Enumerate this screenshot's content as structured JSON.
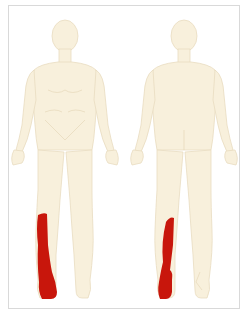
{
  "diagram": {
    "type": "body-pain-map",
    "views": [
      {
        "name": "front",
        "highlighted_regions": [
          "right-lower-leg-lateral",
          "right-foot"
        ]
      },
      {
        "name": "back",
        "highlighted_regions": [
          "left-lower-leg-posterior-lateral",
          "left-heel-foot"
        ]
      }
    ],
    "colors": {
      "skin": "#f8f0dc",
      "outline": "#e6d9bd",
      "highlight": "#c8160c",
      "frame": "#d9d9d9",
      "background": "#ffffff"
    }
  }
}
